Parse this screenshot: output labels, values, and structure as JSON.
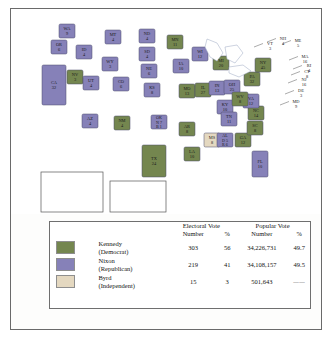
{
  "colors": {
    "democrat": "#74864f",
    "republican": "#8681b8",
    "independent": "#e4d8c0",
    "water": "#ffffff",
    "border": "#4a4a6a"
  },
  "map": {
    "title": "1960 Presidential Election Electoral Map",
    "states": [
      {
        "abbr": "WA",
        "votes": "9",
        "party": "republican",
        "x": 56,
        "y": 22
      },
      {
        "abbr": "OR",
        "votes": "6",
        "party": "republican",
        "x": 48,
        "y": 38
      },
      {
        "abbr": "CA",
        "votes": "32",
        "party": "republican",
        "x": 43,
        "y": 76
      },
      {
        "abbr": "NV",
        "votes": "3",
        "party": "democrat",
        "x": 64,
        "y": 68
      },
      {
        "abbr": "ID",
        "votes": "4",
        "party": "republican",
        "x": 73,
        "y": 43
      },
      {
        "abbr": "MT",
        "votes": "4",
        "party": "republican",
        "x": 102,
        "y": 28
      },
      {
        "abbr": "WY",
        "votes": "3",
        "party": "republican",
        "x": 99,
        "y": 55
      },
      {
        "abbr": "UT",
        "votes": "4",
        "party": "republican",
        "x": 80,
        "y": 74
      },
      {
        "abbr": "CO",
        "votes": "6",
        "party": "republican",
        "x": 110,
        "y": 75
      },
      {
        "abbr": "AZ",
        "votes": "4",
        "party": "republican",
        "x": 79,
        "y": 112
      },
      {
        "abbr": "NM",
        "votes": "4",
        "party": "democrat",
        "x": 111,
        "y": 114
      },
      {
        "abbr": "ND",
        "votes": "4",
        "party": "republican",
        "x": 136,
        "y": 27
      },
      {
        "abbr": "SD",
        "votes": "4",
        "party": "republican",
        "x": 136,
        "y": 45
      },
      {
        "abbr": "NE",
        "votes": "6",
        "party": "republican",
        "x": 138,
        "y": 62
      },
      {
        "abbr": "KS",
        "votes": "8",
        "party": "republican",
        "x": 141,
        "y": 81
      },
      {
        "abbr": "OK",
        "votes": "N 7 / B 1",
        "party": "split",
        "x": 148,
        "y": 113
      },
      {
        "abbr": "TX",
        "votes": "24",
        "party": "democrat",
        "x": 143,
        "y": 152
      },
      {
        "abbr": "MN",
        "votes": "11",
        "party": "democrat",
        "x": 164,
        "y": 33
      },
      {
        "abbr": "IA",
        "votes": "10",
        "party": "republican",
        "x": 170,
        "y": 57
      },
      {
        "abbr": "MO",
        "votes": "13",
        "party": "democrat",
        "x": 176,
        "y": 82
      },
      {
        "abbr": "AR",
        "votes": "8",
        "party": "democrat",
        "x": 176,
        "y": 120
      },
      {
        "abbr": "LA",
        "votes": "10",
        "party": "democrat",
        "x": 181,
        "y": 145
      },
      {
        "abbr": "WI",
        "votes": "12",
        "party": "republican",
        "x": 189,
        "y": 45
      },
      {
        "abbr": "IL",
        "votes": "27",
        "party": "democrat",
        "x": 192,
        "y": 81
      },
      {
        "abbr": "MS",
        "votes": "8",
        "party": "independent",
        "x": 201,
        "y": 131
      },
      {
        "abbr": "MI",
        "votes": "20",
        "party": "democrat",
        "x": 210,
        "y": 54
      },
      {
        "abbr": "IN",
        "votes": "13",
        "party": "republican",
        "x": 206,
        "y": 79
      },
      {
        "abbr": "OH",
        "votes": "25",
        "party": "republican",
        "x": 221,
        "y": 78
      },
      {
        "abbr": "KY",
        "votes": "10",
        "party": "republican",
        "x": 214,
        "y": 98
      },
      {
        "abbr": "TN",
        "votes": "11",
        "party": "republican",
        "x": 218,
        "y": 110
      },
      {
        "abbr": "AL",
        "votes": "D 5 / R 6",
        "party": "split",
        "x": 214,
        "y": 131
      },
      {
        "abbr": "GA",
        "votes": "12",
        "party": "democrat",
        "x": 232,
        "y": 131
      },
      {
        "abbr": "FL",
        "votes": "10",
        "party": "republican",
        "x": 249,
        "y": 155
      },
      {
        "abbr": "SC",
        "votes": "8",
        "party": "democrat",
        "x": 244,
        "y": 119
      },
      {
        "abbr": "NC",
        "votes": "14",
        "party": "democrat",
        "x": 245,
        "y": 104
      },
      {
        "abbr": "VA",
        "votes": "12",
        "party": "republican",
        "x": 240,
        "y": 92
      },
      {
        "abbr": "WV",
        "votes": "8",
        "party": "democrat",
        "x": 229,
        "y": 90
      },
      {
        "abbr": "PA",
        "votes": "32",
        "party": "democrat",
        "x": 241,
        "y": 70
      },
      {
        "abbr": "NY",
        "votes": "45",
        "party": "democrat",
        "x": 252,
        "y": 56
      },
      {
        "abbr": "AK",
        "votes": "3",
        "party": "republican",
        "x": 62,
        "y": 180
      },
      {
        "abbr": "HI",
        "votes": "3",
        "party": "democrat",
        "x": 127,
        "y": 190
      }
    ],
    "callouts": [
      {
        "abbr": "NH",
        "votes": "4",
        "x": 272,
        "y": 31
      },
      {
        "abbr": "VT",
        "votes": "3",
        "x": 259,
        "y": 36
      },
      {
        "abbr": "ME",
        "votes": "5",
        "x": 287,
        "y": 33
      },
      {
        "abbr": "MA",
        "votes": "16",
        "x": 294,
        "y": 49
      },
      {
        "abbr": "RI",
        "votes": "4",
        "x": 298,
        "y": 58
      },
      {
        "abbr": "CT",
        "votes": "8",
        "x": 296,
        "y": 64
      },
      {
        "abbr": "NJ",
        "votes": "16",
        "x": 293,
        "y": 72
      },
      {
        "abbr": "DE",
        "votes": "3",
        "x": 290,
        "y": 83
      },
      {
        "abbr": "MD",
        "votes": "9",
        "x": 285,
        "y": 94
      }
    ]
  },
  "legend": {
    "groups": [
      {
        "label": "Electoral Vote"
      },
      {
        "label": "Popular Vote"
      }
    ],
    "columns": [
      "Number",
      "%",
      "Number",
      "%"
    ],
    "rows": [
      {
        "party": "Kennedy",
        "affiliation": "(Democrat)",
        "color_key": "democrat",
        "electoral_number": "303",
        "electoral_pct": "56",
        "popular_number": "34,226,731",
        "popular_pct": "49.7"
      },
      {
        "party": "Nixon",
        "affiliation": "(Republican)",
        "color_key": "republican",
        "electoral_number": "219",
        "electoral_pct": "41",
        "popular_number": "34,108,157",
        "popular_pct": "49.5"
      },
      {
        "party": "Byrd",
        "affiliation": "(Independent)",
        "color_key": "independent",
        "electoral_number": "15",
        "electoral_pct": "3",
        "popular_number": "501,643",
        "popular_pct": "——"
      }
    ]
  }
}
